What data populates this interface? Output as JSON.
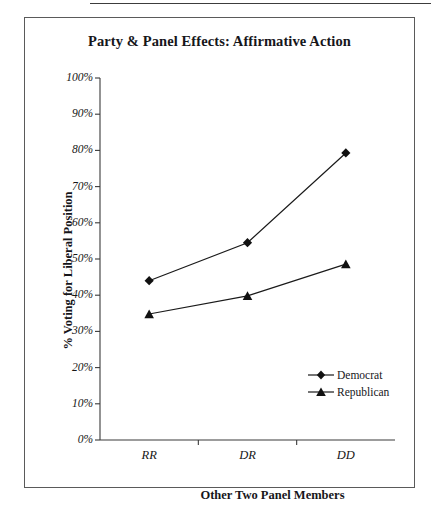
{
  "figure": {
    "title": "Party & Panel Effects: Affirmative Action"
  },
  "chart_data": {
    "type": "line",
    "title": "Party & Panel Effects: Affirmative Action",
    "xlabel": "Other Two Panel Members",
    "ylabel": "% Voting for Liberal Position",
    "categories": [
      "RR",
      "DR",
      "DD"
    ],
    "series": [
      {
        "name": "Democrat",
        "marker": "diamond",
        "values": [
          44,
          54.5,
          79.3
        ]
      },
      {
        "name": "Republican",
        "marker": "triangle",
        "values": [
          34.8,
          39.8,
          48.6
        ]
      }
    ],
    "ylim": [
      0,
      100
    ],
    "ytick_labels": [
      "100%",
      "90%",
      "80%",
      "70%",
      "60%",
      "50%",
      "40%",
      "30%",
      "20%",
      "10%",
      "0%"
    ],
    "ytick_values": [
      100,
      90,
      80,
      70,
      60,
      50,
      40,
      30,
      20,
      10,
      0
    ],
    "xtick_labels": [
      "RR",
      "DR",
      "DD"
    ],
    "grid": false,
    "legend_position": "inside-lower-right",
    "line_color": "#1a1a1a",
    "marker_color": "#111111",
    "background": "#ffffff"
  },
  "legend": {
    "entries": [
      {
        "label": "Democrat"
      },
      {
        "label": "Republican"
      }
    ]
  }
}
